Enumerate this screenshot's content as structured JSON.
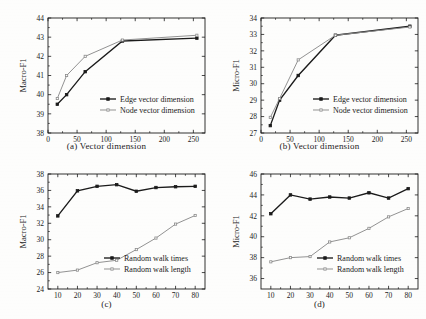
{
  "figure": {
    "background": "#fdfdfc",
    "line_color_dark": "#1b1b1b",
    "line_color_light": "#8c8c8c"
  },
  "chart_data": [
    {
      "id": "a",
      "type": "line",
      "title": "",
      "caption": "(a)  Vector dimension",
      "xlabel": "",
      "ylabel": "Macro-F1",
      "x": [
        16,
        32,
        64,
        128,
        256
      ],
      "xlim": [
        0,
        270
      ],
      "ylim": [
        38,
        44
      ],
      "xticks": [
        0,
        50,
        100,
        150,
        200,
        250
      ],
      "yticks": [
        38,
        39,
        40,
        41,
        42,
        43,
        44
      ],
      "grid": false,
      "legend_position": "lower-right",
      "series": [
        {
          "name": "Edge vector dimension",
          "color": "#1b1b1b",
          "marker": "square-filled",
          "values": [
            39.5,
            40.0,
            41.2,
            42.8,
            42.95
          ]
        },
        {
          "name": "Node vector dimension",
          "color": "#8c8c8c",
          "marker": "square-open",
          "values": [
            39.8,
            41.0,
            42.0,
            42.85,
            43.1
          ]
        }
      ]
    },
    {
      "id": "b",
      "type": "line",
      "title": "",
      "caption": "(b)  Vector dimension",
      "xlabel": "",
      "ylabel": "Micro-F1",
      "x": [
        16,
        32,
        64,
        128,
        256
      ],
      "xlim": [
        0,
        270
      ],
      "ylim": [
        27,
        34
      ],
      "xticks": [
        0,
        50,
        100,
        150,
        200,
        250
      ],
      "yticks": [
        27,
        28,
        29,
        30,
        31,
        32,
        33,
        34
      ],
      "grid": false,
      "legend_position": "lower-right",
      "series": [
        {
          "name": "Edge vector dimension",
          "color": "#1b1b1b",
          "marker": "square-filled",
          "values": [
            27.45,
            29.0,
            30.5,
            32.95,
            33.5
          ]
        },
        {
          "name": "Node vector dimension",
          "color": "#8c8c8c",
          "marker": "square-open",
          "values": [
            27.95,
            29.1,
            31.45,
            32.95,
            33.45
          ]
        }
      ]
    },
    {
      "id": "c",
      "type": "line",
      "title": "",
      "caption": "(c)",
      "xlabel": "",
      "ylabel": "Macro-F1",
      "x": [
        10,
        20,
        30,
        40,
        50,
        60,
        70,
        80
      ],
      "xlim": [
        5,
        85
      ],
      "ylim": [
        24,
        38
      ],
      "xticks": [
        10,
        20,
        30,
        40,
        50,
        60,
        70,
        80
      ],
      "yticks": [
        24,
        26,
        28,
        30,
        32,
        34,
        36,
        38
      ],
      "grid": false,
      "legend_position": "lower-right",
      "series": [
        {
          "name": "Random walk times",
          "color": "#1b1b1b",
          "marker": "square-filled",
          "values": [
            32.9,
            35.95,
            36.5,
            36.7,
            35.9,
            36.35,
            36.45,
            36.5
          ]
        },
        {
          "name": "Random walk length",
          "color": "#8c8c8c",
          "marker": "square-open",
          "values": [
            26.0,
            26.3,
            27.2,
            27.5,
            28.8,
            30.2,
            31.9,
            32.95
          ]
        }
      ]
    },
    {
      "id": "d",
      "type": "line",
      "title": "",
      "caption": "(d)",
      "xlabel": "",
      "ylabel": "Micro-F1",
      "x": [
        10,
        20,
        30,
        40,
        50,
        60,
        70,
        80
      ],
      "xlim": [
        5,
        85
      ],
      "ylim": [
        35,
        46
      ],
      "xticks": [
        10,
        20,
        30,
        40,
        50,
        60,
        70,
        80
      ],
      "yticks": [
        36,
        38,
        40,
        42,
        44,
        46
      ],
      "grid": false,
      "legend_position": "lower-right",
      "series": [
        {
          "name": "Random walk times",
          "color": "#1b1b1b",
          "marker": "square-filled",
          "values": [
            42.2,
            44.0,
            43.6,
            43.8,
            43.7,
            44.2,
            43.7,
            44.6
          ]
        },
        {
          "name": "Random walk length",
          "color": "#8c8c8c",
          "marker": "square-open",
          "values": [
            37.6,
            38.0,
            38.1,
            39.5,
            39.9,
            40.8,
            41.9,
            42.7
          ]
        }
      ]
    }
  ]
}
